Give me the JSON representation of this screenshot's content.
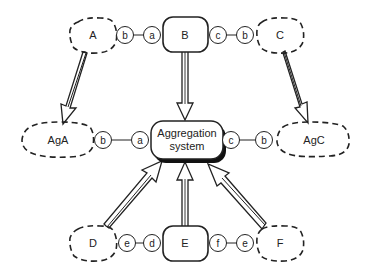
{
  "diagram": {
    "agents": {
      "A": {
        "label": "A",
        "style": "dashed"
      },
      "B": {
        "label": "B",
        "style": "solid"
      },
      "C": {
        "label": "C",
        "style": "dashed"
      },
      "D": {
        "label": "D",
        "style": "dashed"
      },
      "E": {
        "label": "E",
        "style": "solid"
      },
      "F": {
        "label": "F",
        "style": "dashed"
      }
    },
    "aggregates": {
      "AgA": {
        "label": "AgA",
        "style": "dashed"
      },
      "AgC": {
        "label": "AgC",
        "style": "dashed"
      }
    },
    "center": {
      "line1": "Aggregation",
      "line2": "system"
    },
    "ports": {
      "top_left_1": "b",
      "top_left_2": "a",
      "top_right_1": "c",
      "top_right_2": "b",
      "mid_left_1": "b",
      "mid_left_2": "a",
      "mid_right_1": "c",
      "mid_right_2": "b",
      "bot_left_1": "e",
      "bot_left_2": "d",
      "bot_right_1": "f",
      "bot_right_2": "e"
    },
    "arrows": [
      {
        "from": "A",
        "to": "AgA"
      },
      {
        "from": "B",
        "to": "Aggregation system"
      },
      {
        "from": "C",
        "to": "AgC"
      },
      {
        "from": "D",
        "to": "Aggregation system"
      },
      {
        "from": "E",
        "to": "Aggregation system"
      },
      {
        "from": "F",
        "to": "Aggregation system"
      }
    ]
  }
}
